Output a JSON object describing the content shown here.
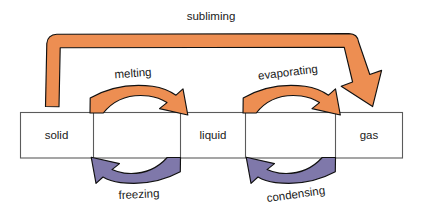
{
  "figure": {
    "title_text": "Phase change diagram",
    "background_color": "#ffffff",
    "box_fill": "#ffffff",
    "box_stroke": "#5b5b5b",
    "warm_arrow_color": "#ed8e52",
    "cool_arrow_color": "#7f78aa",
    "arrow_outline_color": "#111111",
    "text_color": "#1a1a1a"
  },
  "states": [
    {
      "id": "solid",
      "label": "solid"
    },
    {
      "id": "liquid",
      "label": "liquid"
    },
    {
      "id": "gas",
      "label": "gas"
    }
  ],
  "processes": [
    {
      "id": "subliming",
      "label": "subliming",
      "from": "solid",
      "to": "gas",
      "direction": "forward",
      "color": "#ed8e52"
    },
    {
      "id": "melting",
      "label": "melting",
      "from": "solid",
      "to": "liquid",
      "direction": "forward",
      "color": "#ed8e52"
    },
    {
      "id": "evaporating",
      "label": "evaporating",
      "from": "liquid",
      "to": "gas",
      "direction": "forward",
      "color": "#ed8e52"
    },
    {
      "id": "freezing",
      "label": "freezing",
      "from": "liquid",
      "to": "solid",
      "direction": "reverse",
      "color": "#7f78aa"
    },
    {
      "id": "condensing",
      "label": "condensing",
      "from": "gas",
      "to": "liquid",
      "direction": "reverse",
      "color": "#7f78aa"
    }
  ]
}
